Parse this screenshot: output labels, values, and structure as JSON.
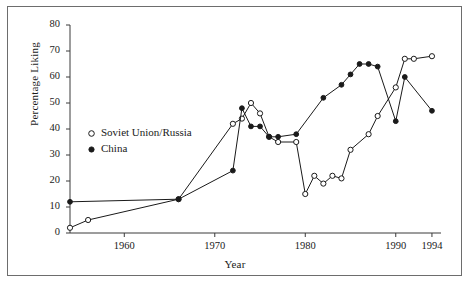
{
  "chart_data": {
    "type": "line",
    "title": "",
    "subtitle": "",
    "xlabel": "Year",
    "ylabel": "Percentage Liking",
    "xlim": [
      1954,
      1995
    ],
    "ylim": [
      0,
      80
    ],
    "yticks": [
      0,
      10,
      20,
      30,
      40,
      50,
      60,
      70,
      80
    ],
    "xticks": [
      1960,
      1970,
      1980,
      1990,
      1994
    ],
    "grid": false,
    "legend_position": "inside-left",
    "series": [
      {
        "name": "Soviet Union/Russia",
        "marker": "open-circle",
        "color": "#1a1a1a",
        "points": [
          {
            "x": 1954,
            "y": 2
          },
          {
            "x": 1956,
            "y": 5
          },
          {
            "x": 1966,
            "y": 13
          },
          {
            "x": 1972,
            "y": 42
          },
          {
            "x": 1973,
            "y": 44
          },
          {
            "x": 1974,
            "y": 50
          },
          {
            "x": 1975,
            "y": 46
          },
          {
            "x": 1976,
            "y": 37
          },
          {
            "x": 1977,
            "y": 35
          },
          {
            "x": 1979,
            "y": 35
          },
          {
            "x": 1980,
            "y": 15
          },
          {
            "x": 1981,
            "y": 22
          },
          {
            "x": 1982,
            "y": 19
          },
          {
            "x": 1983,
            "y": 22
          },
          {
            "x": 1984,
            "y": 21
          },
          {
            "x": 1985,
            "y": 32
          },
          {
            "x": 1987,
            "y": 38
          },
          {
            "x": 1988,
            "y": 45
          },
          {
            "x": 1990,
            "y": 56
          },
          {
            "x": 1991,
            "y": 67
          },
          {
            "x": 1992,
            "y": 67
          },
          {
            "x": 1994,
            "y": 68
          }
        ]
      },
      {
        "name": "China",
        "marker": "filled-circle",
        "color": "#1a1a1a",
        "points": [
          {
            "x": 1954,
            "y": 12
          },
          {
            "x": 1966,
            "y": 13
          },
          {
            "x": 1972,
            "y": 24
          },
          {
            "x": 1973,
            "y": 48
          },
          {
            "x": 1974,
            "y": 41
          },
          {
            "x": 1975,
            "y": 41
          },
          {
            "x": 1976,
            "y": 37
          },
          {
            "x": 1977,
            "y": 37
          },
          {
            "x": 1979,
            "y": 38
          },
          {
            "x": 1982,
            "y": 52
          },
          {
            "x": 1984,
            "y": 57
          },
          {
            "x": 1985,
            "y": 61
          },
          {
            "x": 1986,
            "y": 65
          },
          {
            "x": 1987,
            "y": 65
          },
          {
            "x": 1988,
            "y": 64
          },
          {
            "x": 1990,
            "y": 43
          },
          {
            "x": 1991,
            "y": 60
          },
          {
            "x": 1994,
            "y": 47
          }
        ]
      }
    ],
    "legend": [
      {
        "label": "Soviet Union/Russia",
        "marker": "open-circle"
      },
      {
        "label": "China",
        "marker": "filled-circle"
      }
    ]
  }
}
